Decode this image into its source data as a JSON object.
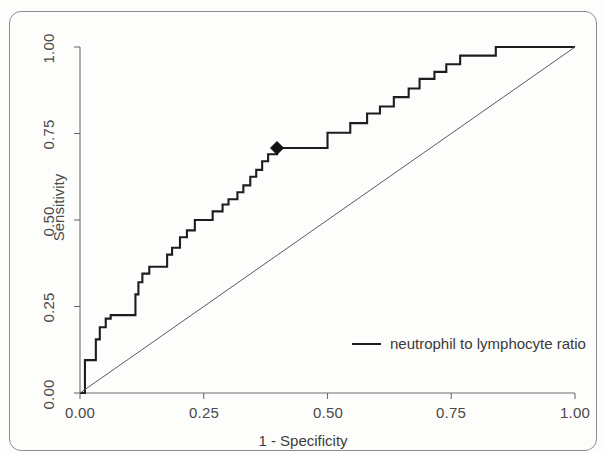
{
  "figure": {
    "background_color": "#fdfdfc",
    "border_color": "#8d8d8d"
  },
  "axes": {
    "x_label": "1 - Specificity",
    "y_label": "Sensitivity",
    "x_ticks": [
      "0.00",
      "0.25",
      "0.50",
      "0.75",
      "1.00"
    ],
    "y_ticks": [
      "0.00",
      "0.25",
      "0.50",
      "0.75",
      "1.00"
    ]
  },
  "legend": {
    "entries": [
      {
        "label": "neutrophil to lymphocyte ratio",
        "color": "#1d1d1d"
      }
    ]
  },
  "chart_data": {
    "type": "line",
    "title": "",
    "subtitle": "",
    "xlabel": "1 - Specificity",
    "ylabel": "Sensitivity",
    "xlim": [
      0,
      1
    ],
    "ylim": [
      0,
      1
    ],
    "xticks": [
      0,
      0.25,
      0.5,
      0.75,
      1
    ],
    "yticks": [
      0,
      0.25,
      0.5,
      0.75,
      1
    ],
    "grid": false,
    "legend_position": "bottom-right",
    "series": [
      {
        "name": "neutrophil to lymphocyte ratio",
        "color": "#1d1d1d",
        "line_width": 2.1,
        "type": "roc-step",
        "points": [
          [
            0.0,
            0.0
          ],
          [
            0.01,
            0.0
          ],
          [
            0.01,
            0.095
          ],
          [
            0.032,
            0.095
          ],
          [
            0.032,
            0.155
          ],
          [
            0.04,
            0.155
          ],
          [
            0.04,
            0.19
          ],
          [
            0.052,
            0.19
          ],
          [
            0.052,
            0.215
          ],
          [
            0.062,
            0.215
          ],
          [
            0.062,
            0.225
          ],
          [
            0.112,
            0.225
          ],
          [
            0.112,
            0.285
          ],
          [
            0.118,
            0.285
          ],
          [
            0.118,
            0.32
          ],
          [
            0.126,
            0.32
          ],
          [
            0.126,
            0.345
          ],
          [
            0.14,
            0.345
          ],
          [
            0.14,
            0.365
          ],
          [
            0.176,
            0.365
          ],
          [
            0.176,
            0.4
          ],
          [
            0.186,
            0.4
          ],
          [
            0.186,
            0.42
          ],
          [
            0.202,
            0.42
          ],
          [
            0.202,
            0.45
          ],
          [
            0.216,
            0.45
          ],
          [
            0.216,
            0.47
          ],
          [
            0.232,
            0.47
          ],
          [
            0.232,
            0.5
          ],
          [
            0.268,
            0.5
          ],
          [
            0.268,
            0.525
          ],
          [
            0.288,
            0.525
          ],
          [
            0.288,
            0.545
          ],
          [
            0.3,
            0.545
          ],
          [
            0.3,
            0.56
          ],
          [
            0.318,
            0.56
          ],
          [
            0.318,
            0.58
          ],
          [
            0.33,
            0.58
          ],
          [
            0.33,
            0.6
          ],
          [
            0.344,
            0.6
          ],
          [
            0.344,
            0.625
          ],
          [
            0.356,
            0.625
          ],
          [
            0.356,
            0.645
          ],
          [
            0.368,
            0.645
          ],
          [
            0.368,
            0.67
          ],
          [
            0.38,
            0.67
          ],
          [
            0.38,
            0.69
          ],
          [
            0.398,
            0.69
          ],
          [
            0.398,
            0.708
          ],
          [
            0.5,
            0.708
          ],
          [
            0.5,
            0.752
          ],
          [
            0.546,
            0.752
          ],
          [
            0.546,
            0.78
          ],
          [
            0.58,
            0.78
          ],
          [
            0.58,
            0.808
          ],
          [
            0.606,
            0.808
          ],
          [
            0.606,
            0.828
          ],
          [
            0.634,
            0.828
          ],
          [
            0.634,
            0.855
          ],
          [
            0.664,
            0.855
          ],
          [
            0.664,
            0.88
          ],
          [
            0.686,
            0.88
          ],
          [
            0.686,
            0.908
          ],
          [
            0.716,
            0.908
          ],
          [
            0.716,
            0.928
          ],
          [
            0.74,
            0.928
          ],
          [
            0.74,
            0.95
          ],
          [
            0.768,
            0.95
          ],
          [
            0.768,
            0.975
          ],
          [
            0.84,
            0.975
          ],
          [
            0.84,
            1.0
          ],
          [
            1.0,
            1.0
          ]
        ]
      },
      {
        "name": "reference-diagonal",
        "color": "#5a5a5a",
        "line_width": 1.0,
        "type": "line",
        "points": [
          [
            0.0,
            0.0
          ],
          [
            1.0,
            1.0
          ]
        ]
      }
    ],
    "markers": [
      {
        "name": "optimal-cutoff",
        "shape": "diamond",
        "x": 0.398,
        "y": 0.708,
        "color": "#111111",
        "size": 10
      }
    ]
  }
}
